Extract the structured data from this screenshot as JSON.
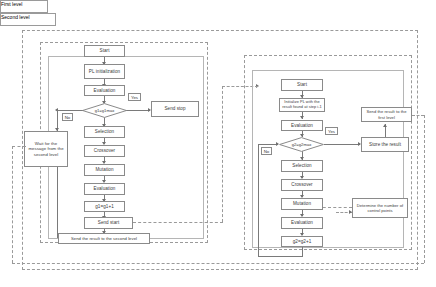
{
  "figure": {
    "type": "flowchart"
  },
  "levels": {
    "first": {
      "title": "First level",
      "nodes": {
        "start": "Start",
        "init": "PL initialization",
        "evaluation_top": "Evaluation",
        "decision": "g1=g1max",
        "yes": "Yes",
        "no": "No",
        "send_stop": "Send stop",
        "wait": "Wait for the message from the second level",
        "selection": "Selection",
        "crossover": "Crossover",
        "mutation": "Mutation",
        "evaluation_bottom": "Evaluation",
        "increment": "g1=g1+1",
        "send_start": "Send start",
        "send_result": "Send the result to the second level"
      }
    },
    "second": {
      "title": "Second level",
      "nodes": {
        "start": "Start",
        "init": "Initialize PL with the result found at step i-1",
        "evaluation_top": "Evaluation",
        "decision": "g2=g2max",
        "yes": "Yes",
        "no": "No",
        "send_result": "Send the result to the first level",
        "store_result": "Store the result",
        "selection": "Selection",
        "crossover": "Crossover",
        "mutation": "Mutation",
        "evaluation_bottom": "Evaluation",
        "increment": "g2=g2+1",
        "control_points": "Determine the number of control points"
      }
    }
  },
  "colors": {
    "border": "#8a8a8a",
    "text": "#3a3a3a",
    "line": "#7a7a7a",
    "dashed": "#9a9a9a",
    "background": "#ffffff"
  }
}
